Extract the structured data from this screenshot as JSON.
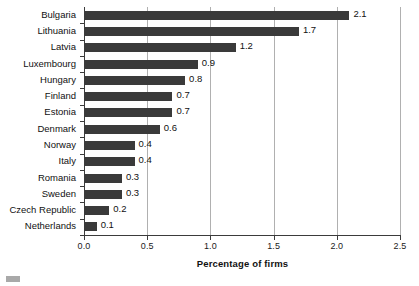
{
  "chart_data": {
    "type": "bar",
    "orientation": "horizontal",
    "title": "",
    "xlabel": "Percentage of firms",
    "ylabel": "",
    "xlim": [
      0.0,
      2.5
    ],
    "xticks": [
      "0.0",
      "0.5",
      "1.0",
      "1.5",
      "2.0",
      "2.5"
    ],
    "grid": "vertical",
    "legend": "none",
    "categories": [
      "Bulgaria",
      "Lithuania",
      "Latvia",
      "Luxembourg",
      "Hungary",
      "Finland",
      "Estonia",
      "Denmark",
      "Norway",
      "Italy",
      "Romania",
      "Sweden",
      "Czech Republic",
      "Netherlands"
    ],
    "values": [
      2.1,
      1.7,
      1.2,
      0.9,
      0.8,
      0.7,
      0.7,
      0.6,
      0.4,
      0.4,
      0.3,
      0.3,
      0.2,
      0.1
    ],
    "value_labels": [
      "2.1",
      "1.7",
      "1.2",
      "0.9",
      "0.8",
      "0.7",
      "0.7",
      "0.6",
      "0.4",
      "0.4",
      "0.3",
      "0.3",
      "0.2",
      "0.1"
    ],
    "bar_color": "#3a3a3a",
    "axis_color": "#3b3b3b",
    "grid_color": "#b0b0b0"
  }
}
